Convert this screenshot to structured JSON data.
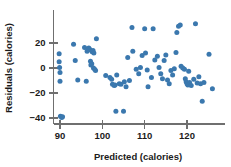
{
  "chart_data": {
    "type": "scatter",
    "title": "",
    "xlabel": "Predicted (calories)",
    "ylabel": "Residuals (calories)",
    "xlim": [
      86.5,
      129.5
    ],
    "ylim": [
      -46,
      38
    ],
    "xticks": [
      90,
      100,
      110,
      120
    ],
    "xtick_labels": [
      "90",
      "100",
      "110",
      "120"
    ],
    "yticks": [
      20,
      0,
      -20,
      -40
    ],
    "ytick_labels": [
      "20",
      "0",
      "−20",
      "−40"
    ],
    "grid": false,
    "legend": null,
    "marker_color": "#3b78ae",
    "axis_color": "#6f6f6f",
    "points": [
      [
        89.8,
        11.5
      ],
      [
        89.8,
        5.0
      ],
      [
        89.9,
        0.5
      ],
      [
        90.0,
        -3.5
      ],
      [
        90.0,
        -10.5
      ],
      [
        90.1,
        -38.5
      ],
      [
        90.4,
        -39.5
      ],
      [
        90.6,
        -39.0
      ],
      [
        93.2,
        19.0
      ],
      [
        93.6,
        6.0
      ],
      [
        94.2,
        -9.5
      ],
      [
        95.8,
        16.5
      ],
      [
        96.4,
        13.5
      ],
      [
        96.6,
        14.5
      ],
      [
        96.8,
        16.0
      ],
      [
        97.0,
        15.0
      ],
      [
        97.2,
        5.5
      ],
      [
        97.3,
        2.5
      ],
      [
        97.5,
        3.5
      ],
      [
        97.6,
        13.0
      ],
      [
        97.8,
        14.0
      ],
      [
        97.9,
        0.0
      ],
      [
        98.0,
        12.0
      ],
      [
        98.2,
        -1.0
      ],
      [
        98.4,
        -2.0
      ],
      [
        96.2,
        -10.5
      ],
      [
        98.6,
        23.5
      ],
      [
        101.8,
        -7.5
      ],
      [
        102.2,
        -9.0
      ],
      [
        102.4,
        -13.0
      ],
      [
        102.8,
        -14.0
      ],
      [
        103.0,
        -13.5
      ],
      [
        103.2,
        -34.5
      ],
      [
        103.4,
        -5.5
      ],
      [
        104.0,
        -12.5
      ],
      [
        104.4,
        -13.0
      ],
      [
        105.0,
        -34.5
      ],
      [
        105.2,
        -11.0
      ],
      [
        105.6,
        -15.0
      ],
      [
        106.0,
        8.5
      ],
      [
        106.4,
        -10.0
      ],
      [
        107.0,
        32.5
      ],
      [
        107.2,
        13.5
      ],
      [
        108.6,
        -4.5
      ],
      [
        109.0,
        0.5
      ],
      [
        109.4,
        10.0
      ],
      [
        110.0,
        31.5
      ],
      [
        110.2,
        12.0
      ],
      [
        110.6,
        -1.5
      ],
      [
        110.8,
        -15.0
      ],
      [
        111.6,
        -7.5
      ],
      [
        112.4,
        6.5
      ],
      [
        113.0,
        9.5
      ],
      [
        113.4,
        0.5
      ],
      [
        113.8,
        -4.5
      ],
      [
        114.2,
        -8.5
      ],
      [
        114.6,
        6.0
      ],
      [
        115.0,
        10.5
      ],
      [
        115.4,
        -9.5
      ],
      [
        115.8,
        -12.5
      ],
      [
        116.2,
        -2.0
      ],
      [
        116.6,
        -5.5
      ],
      [
        117.0,
        -0.5
      ],
      [
        117.4,
        12.5
      ],
      [
        117.6,
        28.5
      ],
      [
        118.0,
        33.5
      ],
      [
        118.4,
        34.5
      ],
      [
        118.6,
        1.5
      ],
      [
        119.0,
        0.0
      ],
      [
        119.4,
        -1.0
      ],
      [
        119.6,
        -8.5
      ],
      [
        119.8,
        -11.0
      ],
      [
        120.0,
        -12.5
      ],
      [
        120.2,
        -13.5
      ],
      [
        120.4,
        -2.5
      ],
      [
        120.6,
        -11.5
      ],
      [
        121.0,
        -14.0
      ],
      [
        121.6,
        -9.0
      ],
      [
        122.0,
        35.5
      ],
      [
        122.4,
        -12.0
      ],
      [
        122.8,
        -7.0
      ],
      [
        123.2,
        -12.5
      ],
      [
        123.6,
        -26.5
      ],
      [
        124.0,
        -11.5
      ],
      [
        125.2,
        11.0
      ],
      [
        126.0,
        -16.5
      ],
      [
        112.0,
        31.5
      ],
      [
        108.0,
        -1.0
      ],
      [
        100.8,
        -6.0
      ]
    ]
  }
}
